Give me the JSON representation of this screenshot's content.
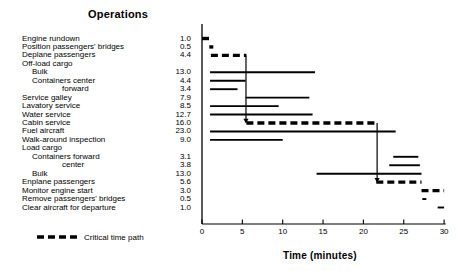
{
  "chart_title": "Operations",
  "axis_title": "Time (minutes)",
  "legend": {
    "label": "Critical time path",
    "style": "dashed-bold"
  },
  "axis": {
    "ticks": [
      "0",
      "5",
      "10",
      "15",
      "20",
      "25",
      "30"
    ],
    "min": 0,
    "max": 30,
    "x_px_at_zero": 202,
    "px_per_minute": 8.07
  },
  "colors": {
    "ink": "#000000",
    "background": "#ffffff"
  },
  "chart_data": {
    "type": "bar",
    "title": "Operations",
    "xlabel": "Time (minutes)",
    "ylabel": "Operations",
    "xlim": [
      0,
      30
    ],
    "grid": false,
    "legend_position": "bottom-left",
    "orientation": "horizontal-gantt",
    "value_column_header": "Duration (minutes)",
    "categories": [
      "Engine rundown",
      "Position passengers' bridges",
      "Deplane passengers",
      "Off-load cargo",
      "Bulk",
      "Containers center",
      "forward",
      "Service galley",
      "Lavatory service",
      "Water service",
      "Cabin service",
      "Fuel aircraft",
      "Walk-around inspection",
      "Load cargo",
      "Containers forward",
      "center",
      "Bulk",
      "Enplane passengers",
      "Monitor engine start",
      "Remove passengers' bridges",
      "Clear aircraft for departure"
    ],
    "values": [
      1.0,
      0.5,
      4.4,
      null,
      13.0,
      4.4,
      3.4,
      7.9,
      8.5,
      12.7,
      16.0,
      23.0,
      9.0,
      null,
      3.1,
      3.8,
      13.0,
      5.6,
      3.0,
      0.5,
      1.0
    ],
    "tasks": [
      {
        "label": "Engine rundown",
        "indent": 0,
        "duration": 1.0,
        "start": 0.0,
        "end": 1.0,
        "critical": true
      },
      {
        "label": "Position passengers' bridges",
        "indent": 0,
        "duration": 0.5,
        "start": 0.9,
        "end": 1.4,
        "critical": true
      },
      {
        "label": "Deplane passengers",
        "indent": 0,
        "duration": 4.4,
        "start": 1.1,
        "end": 5.5,
        "critical": true
      },
      {
        "label": "Off-load cargo",
        "indent": 0,
        "duration": null,
        "start": null,
        "end": null,
        "critical": false
      },
      {
        "label": "Bulk",
        "indent": 1,
        "duration": 13.0,
        "start": 1.0,
        "end": 14.0,
        "critical": false
      },
      {
        "label": "Containers center",
        "indent": 1,
        "duration": 4.4,
        "start": 1.0,
        "end": 5.4,
        "critical": false
      },
      {
        "label": "forward",
        "indent": 3,
        "duration": 3.4,
        "start": 1.0,
        "end": 4.4,
        "critical": false
      },
      {
        "label": "Service galley",
        "indent": 0,
        "duration": 7.9,
        "start": 5.4,
        "end": 13.3,
        "critical": false
      },
      {
        "label": "Lavatory service",
        "indent": 0,
        "duration": 8.5,
        "start": 1.0,
        "end": 9.5,
        "critical": false
      },
      {
        "label": "Water service",
        "indent": 0,
        "duration": 12.7,
        "start": 1.0,
        "end": 13.7,
        "critical": false
      },
      {
        "label": "Cabin service",
        "indent": 0,
        "duration": 16.0,
        "start": 5.5,
        "end": 21.5,
        "critical": true
      },
      {
        "label": "Fuel aircraft",
        "indent": 0,
        "duration": 23.0,
        "start": 1.0,
        "end": 24.0,
        "critical": false
      },
      {
        "label": "Walk-around inspection",
        "indent": 0,
        "duration": 9.0,
        "start": 1.0,
        "end": 10.0,
        "critical": false
      },
      {
        "label": "Load cargo",
        "indent": 0,
        "duration": null,
        "start": null,
        "end": null,
        "critical": false
      },
      {
        "label": "Containers forward",
        "indent": 1,
        "duration": 3.1,
        "start": 23.7,
        "end": 26.8,
        "critical": false
      },
      {
        "label": "center",
        "indent": 3,
        "duration": 3.8,
        "start": 23.2,
        "end": 27.0,
        "critical": false
      },
      {
        "label": "Bulk",
        "indent": 1,
        "duration": 13.0,
        "start": 14.2,
        "end": 27.2,
        "critical": false
      },
      {
        "label": "Enplane passengers",
        "indent": 0,
        "duration": 5.6,
        "start": 21.6,
        "end": 27.2,
        "critical": true
      },
      {
        "label": "Monitor engine start",
        "indent": 0,
        "duration": 3.0,
        "start": 27.2,
        "end": 30.0,
        "critical": true
      },
      {
        "label": "Remove passengers' bridges",
        "indent": 0,
        "duration": 0.5,
        "start": 27.3,
        "end": 27.8,
        "critical": false
      },
      {
        "label": "Clear aircraft for departure",
        "indent": 0,
        "duration": 1.0,
        "start": 29.2,
        "end": 30.0,
        "critical": false
      }
    ],
    "connectors": [
      {
        "name": "deplane-to-cabin-service",
        "x_minute": 5.45,
        "from_row": 2,
        "to_row": 10,
        "arrow": "down"
      },
      {
        "name": "cabin-to-enplane",
        "x_minute": 21.7,
        "from_row": 10,
        "to_row": 17,
        "arrow": "down"
      }
    ]
  }
}
